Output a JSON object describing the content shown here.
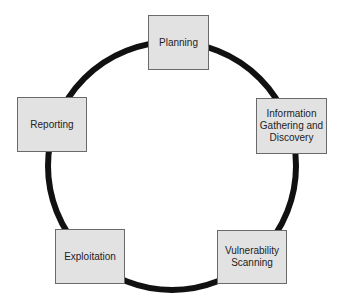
{
  "diagram": {
    "type": "cycle",
    "steps": [
      {
        "id": "planning",
        "label": "Planning"
      },
      {
        "id": "info",
        "label": "Information\nGathering and\nDiscovery"
      },
      {
        "id": "vuln",
        "label": "Vulnerability\nScanning"
      },
      {
        "id": "exploit",
        "label": "Exploitation"
      },
      {
        "id": "reporting",
        "label": "Reporting"
      }
    ],
    "colors": {
      "box_fill": "#e2e2e2",
      "box_border": "#6a6a6a",
      "ring": "#111111"
    }
  }
}
